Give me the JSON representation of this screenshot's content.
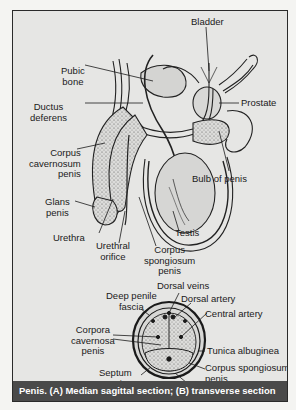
{
  "figure": {
    "caption": "Penis. (A) Median sagittal section; (B) transverse section",
    "colors": {
      "page_background": "#f4f4f2",
      "panel_background": "#e6e6e4",
      "caption_background": "#4a4a4a",
      "caption_text": "#ffffff",
      "ink": "#1a1a1a"
    }
  },
  "sagittal_section": {
    "labels": {
      "bladder": "Bladder",
      "pubic_bone_1": "Pubic",
      "pubic_bone_2": "bone",
      "ductus_1": "Ductus",
      "ductus_2": "deferens",
      "prostate": "Prostate",
      "cc_1": "Corpus",
      "cc_2": "cavernosum",
      "cc_3": "penis",
      "bulb": "Bulb of penis",
      "glans_1": "Glans",
      "glans_2": "penis",
      "testis": "Testis",
      "urethra": "Urethra",
      "orifice_1": "Urethral",
      "orifice_2": "orifice",
      "cs_1": "Corpus",
      "cs_2": "spongiosum",
      "cs_3": "penis"
    }
  },
  "transverse_section": {
    "labels": {
      "dorsal_veins": "Dorsal veins",
      "deep_fascia_1": "Deep penile",
      "deep_fascia_2": "fascia",
      "dorsal_artery": "Dorsal artery",
      "central_artery": "Central artery",
      "corpora_1": "Corpora",
      "corpora_2": "cavernosa",
      "corpora_3": "penis",
      "tunica": "Tunica albuginea",
      "septum_1": "Septum",
      "septum_2": "penis",
      "cs_1": "Corpus spongiosum",
      "cs_2": "penis",
      "urethra": "Urethra"
    }
  }
}
